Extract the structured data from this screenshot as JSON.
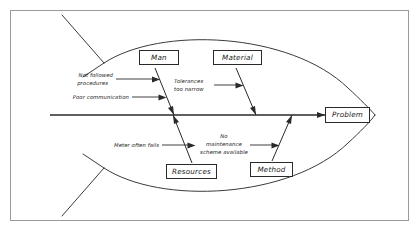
{
  "diagram": {
    "type": "fishbone-ishikawa",
    "title": "",
    "effect": {
      "label": "Problem"
    },
    "categories": [
      {
        "id": "man",
        "label": "Man",
        "side": "top"
      },
      {
        "id": "material",
        "label": "Material",
        "side": "top"
      },
      {
        "id": "resources",
        "label": "Resources",
        "side": "bottom"
      },
      {
        "id": "method",
        "label": "Method",
        "side": "bottom"
      }
    ],
    "causes": [
      {
        "id": "not-followed-procedures",
        "category": "man",
        "lines": [
          "Not followed",
          "procedures"
        ]
      },
      {
        "id": "poor-communication",
        "category": "man",
        "lines": [
          "Poor communication"
        ]
      },
      {
        "id": "tolerances-too-narrow",
        "category": "material",
        "lines": [
          "Tolerances",
          "too narrow"
        ]
      },
      {
        "id": "meter-often-fails",
        "category": "resources",
        "lines": [
          "Meter often fails"
        ]
      },
      {
        "id": "no-maintenance-scheme",
        "category": "method",
        "lines": [
          "No",
          "maintenance",
          "scheme available"
        ]
      }
    ],
    "cause_text": {
      "not_followed_procedures_l1": "Not followed",
      "not_followed_procedures_l2": "procedures",
      "poor_communication": "Poor communication",
      "tolerances_l1": "Tolerances",
      "tolerances_l2": "too narrow",
      "meter_often_fails": "Meter often fails",
      "no_maintenance_l1": "No",
      "no_maintenance_l2": "maintenance",
      "no_maintenance_l3": "scheme available"
    },
    "colors": {
      "frame": "#9a9a9a",
      "outline": "#3a3a3a",
      "ink": "#2a2a2a",
      "background": "#ffffff"
    }
  }
}
